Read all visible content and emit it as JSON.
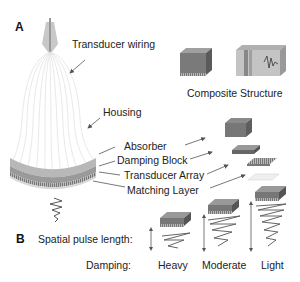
{
  "panel_a": {
    "letter": "A",
    "labels": {
      "transducer_wiring": "Transducer wiring",
      "housing": "Housing",
      "absorber": "Absorber",
      "damping_block": "Damping Block",
      "transducer_array": "Transducer Array",
      "matching_layer": "Matching Layer",
      "composite_structure": "Composite Structure"
    }
  },
  "panel_b": {
    "letter": "B",
    "spatial_pulse_length_label": "Spatial pulse length:",
    "damping_label": "Damping:",
    "levels": [
      {
        "name": "Heavy"
      },
      {
        "name": "Moderate"
      },
      {
        "name": "Light"
      }
    ]
  },
  "colors": {
    "block_top": "#9a9a9a",
    "block_side": "#6e6e6e",
    "arrow": "#555555",
    "housing_band": "#a8a8a8",
    "wire": "#dddddd"
  }
}
